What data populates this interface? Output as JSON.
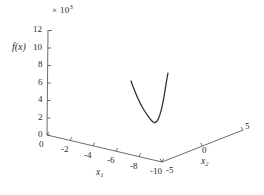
{
  "chart_data": {
    "type": "line",
    "projection": "3d",
    "title": "",
    "subtitle": "",
    "exponent_label": "× 10",
    "exponent_power": "3",
    "zlabel": "f(x)",
    "xlabel": "x",
    "xlabel_sub": "1",
    "ylabel": "x",
    "ylabel_sub": "2",
    "z_ticks": [
      "12",
      "10",
      "8",
      "6",
      "4",
      "2",
      "0"
    ],
    "z_tick_values": [
      12,
      10,
      8,
      6,
      4,
      2,
      0
    ],
    "zlim": [
      0,
      12
    ],
    "z_scale_factor": 1000,
    "x_ticks": [
      "0",
      "-2",
      "-4",
      "-6",
      "-8",
      "-10"
    ],
    "x_tick_values": [
      0,
      -2,
      -4,
      -6,
      -8,
      -10
    ],
    "xlim": [
      0,
      -10
    ],
    "y_ticks": [
      "-5",
      "0",
      "5"
    ],
    "y_tick_values": [
      -5,
      0,
      5
    ],
    "ylim": [
      -5,
      5
    ],
    "grid": false,
    "legend": false,
    "legend_position": "none",
    "series": [
      {
        "name": "trajectory",
        "color": "#2b2b2b",
        "points_px": [
          [
            131.0,
            81.0
          ],
          [
            133.2,
            87.0
          ],
          [
            135.4,
            92.6
          ],
          [
            137.6,
            97.8
          ],
          [
            139.9,
            102.6
          ],
          [
            142.2,
            107.0
          ],
          [
            144.6,
            111.0
          ],
          [
            147.0,
            114.6
          ],
          [
            149.4,
            117.8
          ],
          [
            151.2,
            120.2
          ],
          [
            153.0,
            122.0
          ],
          [
            154.8,
            122.6
          ],
          [
            156.6,
            121.6
          ],
          [
            158.4,
            118.8
          ],
          [
            160.0,
            114.4
          ],
          [
            161.6,
            108.6
          ],
          [
            163.1,
            101.6
          ],
          [
            164.5,
            93.8
          ],
          [
            165.8,
            85.6
          ],
          [
            167.0,
            78.2
          ],
          [
            168.0,
            73.0
          ]
        ]
      }
    ]
  },
  "axes_px": {
    "origin": [
      47,
      135
    ],
    "z_top": [
      48,
      30
    ],
    "x_far": [
      162,
      162
    ],
    "y_far": [
      243,
      130
    ]
  },
  "figure": {
    "background": "#ffffff",
    "axis_color": "#5a5a5a",
    "curve_color": "#2b2b2b",
    "text_color": "#2a2a2a"
  }
}
